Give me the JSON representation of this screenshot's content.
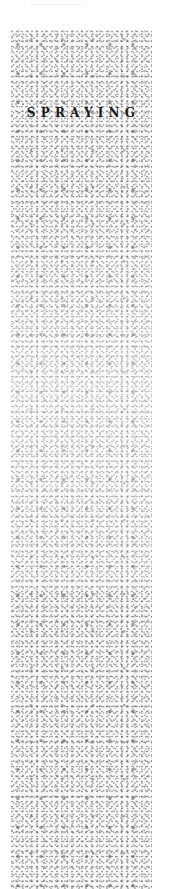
{
  "panel": {
    "title": "SPRAYING",
    "texture": "speckled-spray-pattern",
    "colors": {
      "background": "#ffffff",
      "speckle": "#6e6e6e",
      "title": "#1a1a1a"
    }
  }
}
